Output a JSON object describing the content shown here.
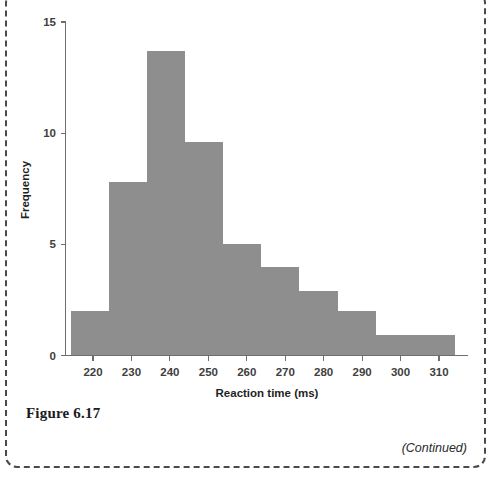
{
  "figure": {
    "caption": "Figure 6.17",
    "continued_note": "(Continued)"
  },
  "colors": {
    "bar_fill": "#8e8e8e",
    "axis": "#6e6e6e",
    "text": "#1f1f1f",
    "box_border": "#4a4a4a",
    "background": "#ffffff"
  },
  "chart_data": {
    "type": "bar",
    "title": "",
    "subtitle": "",
    "xlabel": "Reaction time (ms)",
    "ylabel": "Frequency",
    "xlim": [
      214.3,
      314.1
    ],
    "ylim": [
      0,
      15
    ],
    "grid": false,
    "legend": null,
    "xticks": [
      220,
      230,
      240,
      250,
      260,
      270,
      280,
      290,
      300,
      310
    ],
    "xtick_labels": [
      "220",
      "230",
      "240",
      "250",
      "260",
      "270",
      "280",
      "290",
      "300",
      "310"
    ],
    "yticks": [
      0,
      5,
      10,
      15
    ],
    "ytick_labels": [
      "0",
      "5",
      "10",
      "15"
    ],
    "bin_edges": [
      214.3,
      224.2,
      234.1,
      244.0,
      253.9,
      263.8,
      273.7,
      283.6,
      293.5,
      314.1
    ],
    "bins": [
      {
        "start": 214.3,
        "end": 224.2,
        "frequency": 2
      },
      {
        "start": 224.2,
        "end": 234.1,
        "frequency": 7.8
      },
      {
        "start": 234.1,
        "end": 244.0,
        "frequency": 13.7
      },
      {
        "start": 244.0,
        "end": 253.9,
        "frequency": 9.6
      },
      {
        "start": 253.9,
        "end": 263.8,
        "frequency": 5
      },
      {
        "start": 263.8,
        "end": 273.7,
        "frequency": 4
      },
      {
        "start": 273.7,
        "end": 283.6,
        "frequency": 2.9
      },
      {
        "start": 283.6,
        "end": 293.5,
        "frequency": 2
      },
      {
        "start": 293.5,
        "end": 314.1,
        "frequency": 0.9
      }
    ],
    "categories": [
      "214-224",
      "224-234",
      "234-244",
      "244-254",
      "254-264",
      "264-274",
      "274-284",
      "284-294",
      "294-314"
    ],
    "values": [
      2,
      7.8,
      13.7,
      9.6,
      5,
      4,
      2.9,
      2,
      0.9
    ]
  }
}
